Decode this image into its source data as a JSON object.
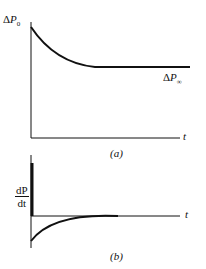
{
  "panel_a": {
    "caption": "(a)",
    "y_label_top": {
      "delta": "Δ",
      "var": "P",
      "sub": "0"
    },
    "asymptote_label": {
      "delta": "Δ",
      "var": "P",
      "sub": "∞"
    },
    "x_label": "t"
  },
  "panel_b": {
    "caption": "(b)",
    "y_label": {
      "num": "dP",
      "den": "dt"
    },
    "x_label": "t"
  },
  "colors": {
    "ink": "#111111",
    "background": "#ffffff"
  }
}
